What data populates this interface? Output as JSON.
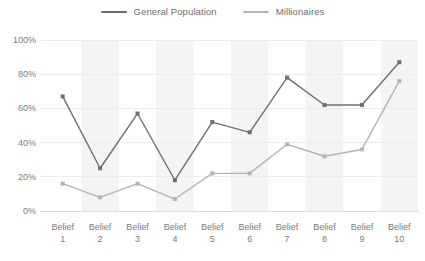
{
  "legend": {
    "position": "top-center",
    "items": [
      {
        "label": "General Population",
        "color": "#6f6f6f",
        "icon": "line-swatch-icon"
      },
      {
        "label": "Millionaires",
        "color": "#b4b4b4",
        "icon": "line-swatch-icon"
      }
    ]
  },
  "axes": {
    "y_ticks": [
      "0%",
      "20%",
      "40%",
      "60%",
      "80%",
      "100%"
    ],
    "x_ticks": [
      {
        "line1": "Belief",
        "line2": "1"
      },
      {
        "line1": "Belief",
        "line2": "2"
      },
      {
        "line1": "Belief",
        "line2": "3"
      },
      {
        "line1": "Belief",
        "line2": "4"
      },
      {
        "line1": "Belief",
        "line2": "5"
      },
      {
        "line1": "Belief",
        "line2": "6"
      },
      {
        "line1": "Belief",
        "line2": "7"
      },
      {
        "line1": "Belief",
        "line2": "8"
      },
      {
        "line1": "Belief",
        "line2": "9"
      },
      {
        "line1": "Belief",
        "line2": "10"
      }
    ]
  },
  "style": {
    "background": "#ffffff",
    "gridline_color": "#ececec",
    "band_color": "#f4f4f4",
    "axis_label_color": "#7a7a7a"
  },
  "chart_data": {
    "type": "line",
    "title": "",
    "xlabel": "",
    "ylabel": "",
    "ylim": [
      0,
      100
    ],
    "ytick_values": [
      0,
      20,
      40,
      60,
      80,
      100
    ],
    "ytick_labels": [
      "0%",
      "20%",
      "40%",
      "60%",
      "80%",
      "100%"
    ],
    "grid": true,
    "grid_axis": "y",
    "alternating_bands": true,
    "banded_categories": [
      "Belief 2",
      "Belief 4",
      "Belief 6",
      "Belief 8",
      "Belief 10"
    ],
    "legend_position": "top-center",
    "marker": "square",
    "categories": [
      "Belief 1",
      "Belief 2",
      "Belief 3",
      "Belief 4",
      "Belief 5",
      "Belief 6",
      "Belief 7",
      "Belief 8",
      "Belief 9",
      "Belief 10"
    ],
    "series": [
      {
        "name": "General Population",
        "color": "#6f6f6f",
        "values": [
          67,
          25,
          57,
          18,
          52,
          46,
          78,
          62,
          62,
          87
        ]
      },
      {
        "name": "Millionaires",
        "color": "#b4b4b4",
        "values": [
          16,
          8,
          16,
          7,
          22,
          22,
          39,
          32,
          36,
          76
        ]
      }
    ]
  }
}
